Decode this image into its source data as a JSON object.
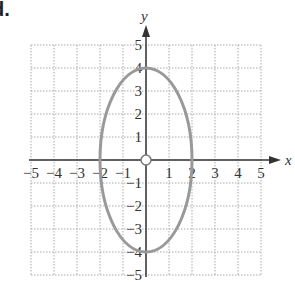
{
  "problem_label": "d.",
  "chart_data": {
    "type": "line",
    "title": "",
    "xlabel": "x",
    "ylabel": "y",
    "xlim": [
      -5,
      5
    ],
    "ylim": [
      -5,
      5
    ],
    "grid": true,
    "x_ticks": [
      "−5",
      "−4",
      "−3",
      "−2",
      "−1",
      "1",
      "2",
      "3",
      "4",
      "5"
    ],
    "y_ticks": [
      "5",
      "4",
      "3",
      "2",
      "1",
      "−1",
      "−2",
      "−3",
      "−4",
      "−5"
    ],
    "series": [
      {
        "name": "ellipse",
        "equation": "x^2/4 + y^2/16 = 1",
        "center": [
          0,
          0
        ],
        "semi_axis_x": 2,
        "semi_axis_y": 4,
        "color": "#999999",
        "points": [
          [
            0,
            4
          ],
          [
            2,
            0
          ],
          [
            0,
            -4
          ],
          [
            -2,
            0
          ]
        ]
      }
    ],
    "annotations": [
      {
        "type": "open-circle",
        "x": 0,
        "y": 0
      }
    ]
  },
  "colors": {
    "axis": "#333333",
    "grid": "#aaaaaa",
    "curve": "#999999"
  }
}
